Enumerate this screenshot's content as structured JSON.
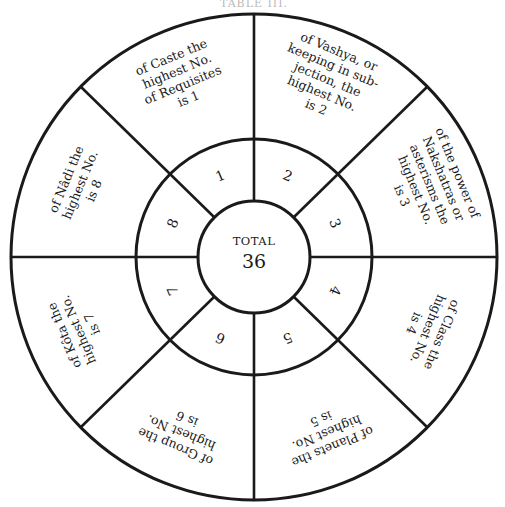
{
  "heading": "TABLE III.",
  "center": {
    "label": "TOTAL",
    "value": "36"
  },
  "segments": [
    {
      "number": "1",
      "lines": [
        "of Caste the",
        "highest No.",
        "of Requisites",
        "is 1"
      ]
    },
    {
      "number": "2",
      "lines": [
        "of Vashya, or",
        "keeping in sub-",
        "jection, the",
        "highest No.",
        "is 2"
      ]
    },
    {
      "number": "3",
      "lines": [
        "of the power of",
        "Nakshatras or",
        "asterisms the",
        "highest No.",
        "is 3"
      ]
    },
    {
      "number": "4",
      "lines": [
        "of Class the",
        "highest No.",
        "is 4"
      ]
    },
    {
      "number": "5",
      "lines": [
        "of Planets the",
        "highest No.",
        "is 5"
      ]
    },
    {
      "number": "6",
      "lines": [
        "of Group the",
        "highest No.",
        "is 6"
      ]
    },
    {
      "number": "7",
      "lines": [
        "of Kôta the",
        "highest No.",
        "is 7"
      ]
    },
    {
      "number": "8",
      "lines": [
        "of Nâdi the",
        "highest No.",
        "is 8"
      ]
    }
  ],
  "colors": {
    "ink": "#1a1a1a",
    "paper": "#ffffff"
  }
}
